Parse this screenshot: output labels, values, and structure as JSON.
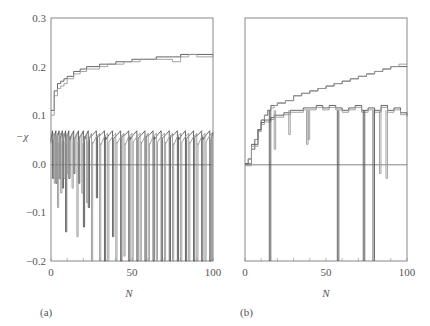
{
  "chart_data": [
    {
      "type": "line",
      "panel": "(a)",
      "xlabel": "N",
      "ylabel": "−χ",
      "xlim": [
        0,
        100
      ],
      "ylim": [
        -0.2,
        0.3
      ],
      "xticks": [
        "0",
        "50",
        "100"
      ],
      "yticks": [
        "0.3",
        "0.2",
        "0.1",
        "0.0",
        "−0.1",
        "−0.2"
      ],
      "grid": false,
      "reference_line": 0.0,
      "series": [
        {
          "name": "upper-curve-1",
          "x": [
            0,
            2,
            4,
            6,
            8,
            10,
            14,
            18,
            22,
            26,
            30,
            35,
            40,
            45,
            50,
            55,
            60,
            65,
            70,
            75,
            80,
            85,
            90,
            95,
            100
          ],
          "values": [
            0.11,
            0.15,
            0.165,
            0.17,
            0.175,
            0.18,
            0.19,
            0.195,
            0.2,
            0.2,
            0.205,
            0.205,
            0.21,
            0.21,
            0.215,
            0.215,
            0.215,
            0.22,
            0.22,
            0.22,
            0.225,
            0.225,
            0.225,
            0.225,
            0.225
          ]
        },
        {
          "name": "upper-curve-2",
          "x": [
            0,
            2,
            4,
            6,
            8,
            10,
            14,
            18,
            22,
            26,
            30,
            35,
            40,
            45,
            50,
            55,
            60,
            65,
            70,
            75,
            80,
            85,
            90,
            95,
            100
          ],
          "values": [
            0.1,
            0.14,
            0.155,
            0.16,
            0.165,
            0.175,
            0.185,
            0.19,
            0.195,
            0.195,
            0.2,
            0.205,
            0.205,
            0.21,
            0.21,
            0.215,
            0.215,
            0.215,
            0.215,
            0.21,
            0.22,
            0.225,
            0.22,
            0.22,
            0.225
          ]
        },
        {
          "name": "lower-trace-1",
          "drops_at": [
            1,
            3,
            5,
            7,
            9,
            11,
            14,
            17,
            20,
            23,
            28,
            33,
            38,
            43,
            48,
            53,
            58,
            63,
            68,
            73,
            78,
            83,
            88,
            93,
            98
          ],
          "plateau": 0.065,
          "drop_to": [
            -0.03,
            -0.04,
            -0.03,
            -0.05,
            -0.14,
            -0.03,
            -0.02,
            -0.04,
            -0.13,
            -0.09,
            -0.07,
            -0.2,
            -0.15,
            -0.2,
            -0.2,
            -0.2,
            -0.2,
            -0.2,
            -0.2,
            -0.2,
            -0.2,
            -0.2,
            -0.2,
            -0.2,
            -0.2
          ]
        },
        {
          "name": "lower-trace-2",
          "drops_at": [
            2,
            4,
            6,
            8,
            10,
            13,
            16,
            19,
            22,
            25,
            30,
            35,
            40,
            45,
            50,
            55,
            60,
            65,
            70,
            75,
            80,
            85,
            90,
            95,
            99
          ],
          "plateau": 0.06,
          "drop_to": [
            -0.04,
            -0.09,
            -0.06,
            -0.03,
            -0.02,
            -0.05,
            -0.15,
            -0.06,
            -0.08,
            -0.2,
            -0.2,
            -0.2,
            -0.2,
            -0.19,
            -0.2,
            -0.2,
            -0.2,
            -0.2,
            -0.2,
            -0.2,
            -0.2,
            -0.2,
            -0.2,
            -0.2,
            -0.2
          ]
        }
      ]
    },
    {
      "type": "line",
      "panel": "(b)",
      "xlabel": "N",
      "ylabel": "",
      "xlim": [
        0,
        100
      ],
      "ylim": [
        -0.2,
        0.3
      ],
      "xticks": [
        "0",
        "50",
        "100"
      ],
      "yticks": [],
      "grid": false,
      "reference_line": 0.0,
      "series": [
        {
          "name": "upper-curve-1",
          "x": [
            0,
            2,
            4,
            6,
            8,
            10,
            12,
            14,
            16,
            18,
            20,
            25,
            30,
            35,
            40,
            45,
            50,
            55,
            60,
            65,
            70,
            75,
            80,
            85,
            90,
            95,
            100
          ],
          "values": [
            0.0,
            0.01,
            0.03,
            0.05,
            0.07,
            0.09,
            0.1,
            0.11,
            0.12,
            0.12,
            0.125,
            0.13,
            0.14,
            0.145,
            0.15,
            0.155,
            0.16,
            0.165,
            0.17,
            0.175,
            0.18,
            0.185,
            0.19,
            0.195,
            0.2,
            0.2,
            0.2
          ]
        },
        {
          "name": "upper-curve-2",
          "x": [
            0,
            2,
            4,
            6,
            8,
            10,
            12,
            14,
            16,
            18,
            20,
            25,
            30,
            35,
            40,
            45,
            50,
            55,
            60,
            65,
            70,
            75,
            80,
            85,
            90,
            95,
            100
          ],
          "values": [
            0.0,
            0.01,
            0.03,
            0.05,
            0.07,
            0.09,
            0.1,
            0.11,
            0.115,
            0.12,
            0.125,
            0.13,
            0.14,
            0.145,
            0.15,
            0.155,
            0.16,
            0.165,
            0.17,
            0.175,
            0.18,
            0.185,
            0.19,
            0.195,
            0.2,
            0.205,
            0.205
          ]
        },
        {
          "name": "lower-trace",
          "x": [
            0,
            4,
            8,
            10,
            12,
            14,
            16,
            18,
            20,
            24,
            28,
            32,
            36,
            40,
            44,
            48,
            52,
            56,
            60,
            64,
            68,
            72,
            76,
            80,
            84,
            88,
            92,
            96,
            100
          ],
          "values": [
            0.0,
            0.04,
            0.07,
            0.085,
            0.09,
            0.09,
            0.095,
            0.1,
            0.1,
            0.105,
            0.11,
            0.11,
            0.115,
            0.115,
            0.12,
            0.115,
            0.12,
            0.115,
            0.11,
            0.115,
            0.12,
            0.11,
            0.115,
            0.11,
            0.12,
            0.11,
            0.115,
            0.105,
            0.1
          ],
          "deep_drops_at": [
            15,
            57,
            73,
            79
          ],
          "shallow_drops": [
            {
              "x": 18,
              "to": 0.03
            },
            {
              "x": 27,
              "to": 0.06
            },
            {
              "x": 38,
              "to": 0.04
            },
            {
              "x": 39,
              "to": 0.05
            },
            {
              "x": 83,
              "to": -0.02
            },
            {
              "x": 87,
              "to": -0.03
            }
          ]
        }
      ]
    }
  ],
  "panels": {
    "a": {
      "label": "(a)",
      "xlabel": "N",
      "ylabel": "−χ"
    },
    "b": {
      "label": "(b)",
      "xlabel": "N"
    }
  }
}
